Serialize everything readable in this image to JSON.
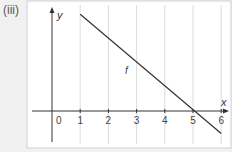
{
  "part_label": "(iii)",
  "axes": {
    "x_label": "x",
    "y_label": "y",
    "origin_label": "0"
  },
  "x_ticks": [
    "1",
    "2",
    "3",
    "4",
    "5",
    "6"
  ],
  "line_label": "f",
  "chart_data": {
    "type": "line",
    "title": "",
    "xlabel": "x",
    "ylabel": "y",
    "xlim": [
      -1.2,
      6.4
    ],
    "x_ticks": [
      1,
      2,
      3,
      4,
      5,
      6
    ],
    "grid": "vertical",
    "series": [
      {
        "name": "f",
        "x": [
          1,
          6
        ],
        "y": [
          4.3,
          -1
        ]
      }
    ]
  }
}
